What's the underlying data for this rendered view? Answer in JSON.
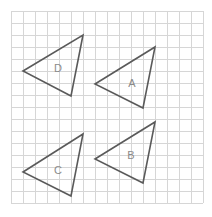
{
  "diagram": {
    "grid": {
      "x0": 11,
      "y0": 11,
      "cell": 12,
      "cols": 16,
      "rows": 16,
      "color": "#d6d6d6"
    },
    "stroke_color": "#5a5a5a",
    "label_color": "#8a8a8a",
    "triangles": [
      {
        "label": "D",
        "points": [
          [
            23,
            71
          ],
          [
            83,
            35
          ],
          [
            71,
            96
          ]
        ],
        "label_pos": [
          58,
          72
        ]
      },
      {
        "label": "A",
        "points": [
          [
            95,
            84
          ],
          [
            155,
            47
          ],
          [
            143,
            108
          ]
        ],
        "label_pos": [
          132,
          87
        ]
      },
      {
        "label": "C",
        "points": [
          [
            23,
            172
          ],
          [
            83,
            134
          ],
          [
            71,
            196
          ]
        ],
        "label_pos": [
          58,
          174
        ]
      },
      {
        "label": "B",
        "points": [
          [
            95,
            159
          ],
          [
            155,
            122
          ],
          [
            143,
            183
          ]
        ],
        "label_pos": [
          131,
          159
        ]
      }
    ]
  }
}
